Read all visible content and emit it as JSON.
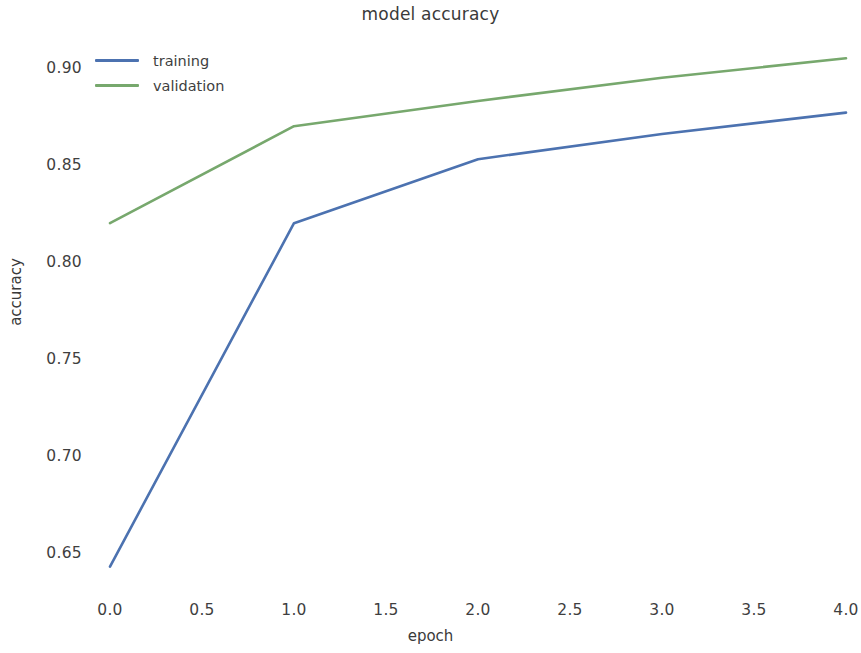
{
  "chart_data": {
    "type": "line",
    "title": "model accuracy",
    "xlabel": "epoch",
    "ylabel": "accuracy",
    "x": [
      0,
      1,
      2,
      3,
      4
    ],
    "series": [
      {
        "name": "training",
        "color": "#4c72b0",
        "values": [
          0.643,
          0.82,
          0.853,
          0.866,
          0.877
        ]
      },
      {
        "name": "validation",
        "color": "#77a86d",
        "values": [
          0.82,
          0.87,
          0.883,
          0.895,
          0.905
        ]
      }
    ],
    "xlim": [
      0.0,
      4.0
    ],
    "ylim": [
      0.6295,
      0.9145
    ],
    "xticks": [
      0.0,
      0.5,
      1.0,
      1.5,
      2.0,
      2.5,
      3.0,
      3.5,
      4.0
    ],
    "xtick_labels": [
      "0.0",
      "0.5",
      "1.0",
      "1.5",
      "2.0",
      "2.5",
      "3.0",
      "3.5",
      "4.0"
    ],
    "yticks": [
      0.65,
      0.7,
      0.75,
      0.8,
      0.85,
      0.9
    ],
    "ytick_labels": [
      "0.65",
      "0.70",
      "0.75",
      "0.80",
      "0.85",
      "0.90"
    ],
    "grid": false,
    "legend_position": "upper left",
    "legend_entries": [
      "training",
      "validation"
    ],
    "background": "#ffffff"
  }
}
